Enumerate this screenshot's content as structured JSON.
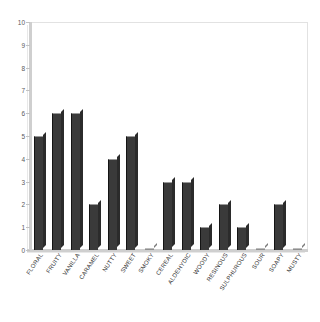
{
  "chart_data": {
    "type": "bar",
    "title": "",
    "xlabel": "",
    "ylabel": "",
    "ylim": [
      0,
      10
    ],
    "ytick_labels": [
      "10",
      "9",
      "8",
      "7",
      "6",
      "5",
      "4",
      "3",
      "2",
      "1",
      "0"
    ],
    "yticks": [
      10,
      9,
      8,
      7,
      6,
      5,
      4,
      3,
      2,
      1,
      0
    ],
    "grid": false,
    "legend": null,
    "bar_color": "#3a3a3a",
    "plot_background": "#ffffff",
    "categories": [
      "FLORAL",
      "FRUITY",
      "VANILLA",
      "CARAMEL",
      "NUTTY",
      "SWEET",
      "SMOKY",
      "CEREAL",
      "ALDEHYDIC",
      "WOODY",
      "RESINOUS",
      "SULPHUROUS",
      "SOUR",
      "SOAPY",
      "MUSTY"
    ],
    "values": [
      5,
      6,
      6,
      2,
      4,
      5,
      0,
      3,
      3,
      1,
      2,
      1,
      0,
      2,
      0
    ]
  }
}
